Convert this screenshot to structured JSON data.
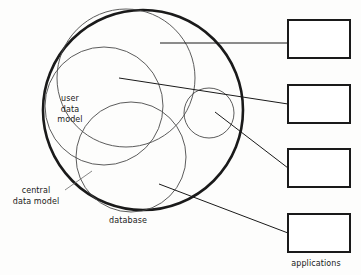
{
  "diagram": {
    "labels": {
      "user_data_model": "user\ndata\nmodel",
      "user_data_model_line1": "user",
      "user_data_model_line2": "data",
      "user_data_model_line3": "model",
      "central_data_model_line1": "central",
      "central_data_model_line2": "data model",
      "database": "database",
      "applications": "applications"
    },
    "colors": {
      "stroke_heavy": "#1a1a1a",
      "stroke_light": "#4a4a4a",
      "background": "#fdfdfc",
      "text": "#1a1a1a"
    },
    "shapes": {
      "outer_circle": {
        "name": "central-data-model-circle",
        "cx": 143,
        "cy": 110,
        "r": 100,
        "stroke_width": 2.6,
        "fill": "none"
      },
      "inner_circles": [
        {
          "name": "user-data-model-circle",
          "cx": 126,
          "cy": 78,
          "r": 69,
          "stroke_width": 0.9
        },
        {
          "name": "second-domain-circle",
          "cx": 104,
          "cy": 106,
          "r": 59,
          "stroke_width": 0.9
        },
        {
          "name": "database-circle",
          "cx": 131,
          "cy": 157,
          "r": 55,
          "stroke_width": 0.9
        },
        {
          "name": "small-application-circle",
          "cx": 209,
          "cy": 113,
          "r": 25,
          "stroke_width": 0.9
        }
      ],
      "rectangles": [
        {
          "name": "application-box-1",
          "x": 288,
          "y": 20,
          "width": 62,
          "height": 38
        },
        {
          "name": "application-box-2",
          "x": 288,
          "y": 85,
          "width": 62,
          "height": 38
        },
        {
          "name": "application-box-3",
          "x": 288,
          "y": 149,
          "width": 62,
          "height": 38
        },
        {
          "name": "application-box-4",
          "x": 288,
          "y": 214,
          "width": 62,
          "height": 38
        }
      ],
      "leader_lines": [
        {
          "name": "leader-line-1",
          "x1": 160,
          "y1": 43,
          "x2": 288,
          "y2": 43
        },
        {
          "name": "leader-line-2",
          "x1": 119,
          "y1": 78,
          "x2": 288,
          "y2": 104
        },
        {
          "name": "leader-line-3",
          "x1": 215,
          "y1": 112,
          "x2": 288,
          "y2": 168
        },
        {
          "name": "leader-line-4",
          "x1": 159,
          "y1": 184,
          "x2": 288,
          "y2": 233
        },
        {
          "name": "leader-line-central-data-model",
          "x1": 65,
          "y1": 190,
          "x2": 92,
          "y2": 171
        }
      ]
    }
  }
}
